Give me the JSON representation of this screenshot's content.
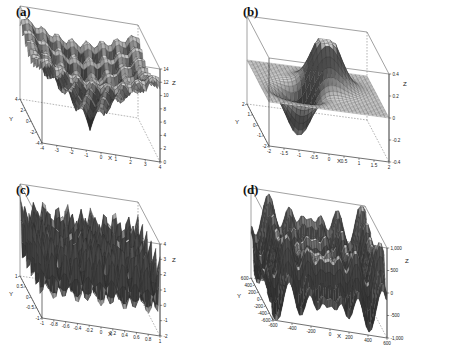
{
  "figure": {
    "background": "#ffffff",
    "ink": "#1a1a1a",
    "panel_count": 4
  },
  "panels": [
    {
      "id": "a",
      "label": "(a)",
      "xlabel": "X",
      "ylabel": "Y",
      "zlabel": "Z"
    },
    {
      "id": "b",
      "label": "(b)",
      "xlabel": "X",
      "ylabel": "Y",
      "zlabel": "Z"
    },
    {
      "id": "c",
      "label": "(c)",
      "xlabel": "X",
      "ylabel": "Y",
      "zlabel": "Z"
    },
    {
      "id": "d",
      "label": "(d)",
      "xlabel": "X",
      "ylabel": "Y",
      "zlabel": "Z"
    }
  ],
  "chart_data": [
    {
      "type": "surface",
      "panel": "a",
      "title": "(a)",
      "xlabel": "X",
      "ylabel": "Y",
      "zlabel": "Z",
      "xlim": [
        -4,
        4
      ],
      "ylim": [
        -4,
        4
      ],
      "zlim": [
        0,
        14
      ],
      "xticks": [
        -4,
        -3,
        -2,
        -1,
        0,
        1,
        2,
        3,
        4
      ],
      "xticklabels": [
        "-4",
        "-3",
        "-2",
        "-1",
        "0",
        "1",
        "2",
        "3",
        "4"
      ],
      "yticks": [
        -4,
        -2,
        0,
        2,
        4
      ],
      "yticklabels": [
        "-4",
        "-2",
        "0",
        "2",
        "4"
      ],
      "zticks": [
        0,
        2,
        4,
        6,
        8,
        10,
        12,
        14
      ],
      "zticklabels": [
        "0",
        "2",
        "4",
        "6",
        "8",
        "10",
        "12",
        "14"
      ],
      "surface_kind": "ackley",
      "description": "Ackley function: multimodal bowl with dense cosine ripples and a single deep global minimum near the origin",
      "mesh": "wireframe",
      "grid": false,
      "legend": null
    },
    {
      "type": "surface",
      "panel": "b",
      "title": "(b)",
      "xlabel": "X",
      "ylabel": "Y",
      "zlabel": "Z",
      "xlim": [
        -2,
        2
      ],
      "ylim": [
        -2,
        2
      ],
      "zlim": [
        -0.4,
        0.4
      ],
      "xticks": [
        -2,
        -1.5,
        -1,
        -0.5,
        0,
        0.5,
        1,
        1.5,
        2
      ],
      "xticklabels": [
        "-2",
        "-1.5",
        "-1",
        "-0.5",
        "0",
        "0.5",
        "1",
        "1.5",
        "2"
      ],
      "yticks": [
        -2,
        -1,
        0,
        1,
        2
      ],
      "yticklabels": [
        "-2",
        "-1",
        "0",
        "1",
        "2"
      ],
      "zticks": [
        -0.4,
        -0.2,
        0,
        0.2,
        0.4
      ],
      "zticklabels": [
        "-0.4",
        "-0.2",
        "0",
        "0.2",
        "0.4"
      ],
      "surface_kind": "gaussian-dipole",
      "description": "Smooth saddle-free surface with one positive peak near +0.45 and one negative well near -0.35, flat elsewhere",
      "mesh": "wireframe",
      "grid": false,
      "legend": null
    },
    {
      "type": "surface",
      "panel": "c",
      "title": "(c)",
      "xlabel": "X",
      "ylabel": "Y",
      "zlabel": "Z",
      "xlim": [
        -1,
        1
      ],
      "ylim": [
        -1,
        1
      ],
      "zlim": [
        -2,
        4
      ],
      "xticks": [
        -1,
        -0.8,
        -0.6,
        -0.4,
        -0.2,
        0,
        0.2,
        0.4,
        0.6,
        0.8,
        1
      ],
      "xticklabels": [
        "-1",
        "-0.8",
        "-0.6",
        "-0.4",
        "-0.2",
        "0",
        "0.2",
        "0.4",
        "0.6",
        "0.8",
        "1"
      ],
      "yticks": [
        -1,
        -0.5,
        0,
        0.5,
        1
      ],
      "yticklabels": [
        "-1",
        "-0.5",
        "0",
        "0.5",
        "1"
      ],
      "zticks": [
        -2,
        -1,
        0,
        1,
        2,
        3,
        4
      ],
      "zticklabels": [
        "-2",
        "-1",
        "0",
        "1",
        "2",
        "3",
        "4"
      ],
      "surface_kind": "egg-carton",
      "description": "Periodic egg-carton surface with roughly five sinusoidal peak rows along X and Y",
      "mesh": "wireframe",
      "grid": false,
      "legend": null
    },
    {
      "type": "surface",
      "panel": "d",
      "title": "(d)",
      "xlabel": "X",
      "ylabel": "Y",
      "zlabel": "Z",
      "xlim": [
        -600,
        600
      ],
      "ylim": [
        -600,
        600
      ],
      "zlim": [
        -1000,
        1000
      ],
      "xticks": [
        -600,
        -400,
        -200,
        0,
        200,
        400,
        600
      ],
      "xticklabels": [
        "-600",
        "-400",
        "-200",
        "0",
        "200",
        "400",
        "600"
      ],
      "yticks": [
        -600,
        -400,
        -200,
        0,
        200,
        400,
        600
      ],
      "yticklabels": [
        "-600",
        "-400",
        "-200",
        "0",
        "200",
        "400",
        "600"
      ],
      "zticks": [
        -1000,
        -500,
        0,
        500,
        1000
      ],
      "zticklabels": [
        "-1,000",
        "-500",
        "0",
        "500",
        "1,000"
      ],
      "surface_kind": "schwefel",
      "description": "Schwefel function: rugged surface with many sharp spikes rising toward the domain corners",
      "mesh": "wireframe",
      "grid": false,
      "legend": null
    }
  ]
}
